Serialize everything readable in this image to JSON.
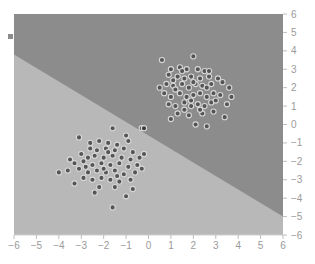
{
  "chart_data": {
    "type": "scatter",
    "title": "",
    "xlabel": "",
    "ylabel": "",
    "xlim": [
      -6,
      6
    ],
    "ylim": [
      -6,
      6
    ],
    "grid": false,
    "legend": null,
    "x_ticks": [
      -6,
      -5,
      -4,
      -3,
      -2,
      -1,
      0,
      1,
      2,
      3,
      4,
      5,
      6
    ],
    "y_ticks": [
      6,
      5,
      4,
      3,
      2,
      1,
      0,
      -1,
      -2,
      -3,
      -4,
      -5,
      -6
    ],
    "y_axis_position": "right",
    "decision_boundary": {
      "type": "line",
      "from": [
        -6,
        3.8
      ],
      "to": [
        6,
        -5.0
      ],
      "region_upper_color": "#8c8c8c",
      "region_lower_color": "#b8b8b8"
    },
    "series": [
      {
        "name": "class_upper_right",
        "center": [
          2,
          2
        ],
        "point_color": "#555555",
        "points": [
          [
            0.6,
            3.5
          ],
          [
            2.0,
            3.7
          ],
          [
            1.0,
            3.0
          ],
          [
            1.4,
            3.1
          ],
          [
            1.7,
            3.0
          ],
          [
            2.2,
            3.0
          ],
          [
            2.5,
            2.9
          ],
          [
            0.9,
            2.7
          ],
          [
            1.3,
            2.6
          ],
          [
            1.6,
            2.5
          ],
          [
            1.9,
            2.6
          ],
          [
            2.3,
            2.5
          ],
          [
            2.7,
            2.6
          ],
          [
            3.1,
            2.5
          ],
          [
            0.8,
            2.2
          ],
          [
            1.1,
            2.1
          ],
          [
            1.5,
            2.2
          ],
          [
            1.8,
            2.0
          ],
          [
            2.1,
            2.2
          ],
          [
            2.4,
            2.1
          ],
          [
            2.8,
            2.2
          ],
          [
            3.3,
            2.3
          ],
          [
            3.6,
            2.0
          ],
          [
            0.7,
            1.7
          ],
          [
            1.0,
            1.5
          ],
          [
            1.4,
            1.7
          ],
          [
            1.7,
            1.5
          ],
          [
            2.0,
            1.6
          ],
          [
            2.3,
            1.7
          ],
          [
            2.6,
            1.5
          ],
          [
            2.9,
            1.7
          ],
          [
            3.2,
            1.6
          ],
          [
            0.9,
            1.1
          ],
          [
            1.2,
            1.0
          ],
          [
            1.6,
            1.2
          ],
          [
            1.9,
            1.0
          ],
          [
            2.2,
            1.1
          ],
          [
            2.5,
            1.0
          ],
          [
            2.8,
            1.2
          ],
          [
            3.5,
            1.1
          ],
          [
            1.3,
            0.6
          ],
          [
            1.8,
            0.5
          ],
          [
            2.4,
            0.6
          ],
          [
            2.9,
            0.7
          ],
          [
            3.4,
            0.4
          ],
          [
            1.0,
            0.3
          ],
          [
            2.1,
            0.0
          ],
          [
            2.6,
            -0.1
          ],
          [
            1.5,
            2.9
          ],
          [
            2.0,
            2.3
          ],
          [
            1.2,
            1.9
          ],
          [
            2.6,
            2.0
          ],
          [
            1.9,
            1.3
          ],
          [
            2.3,
            0.8
          ],
          [
            1.6,
            0.8
          ],
          [
            3.0,
            1.3
          ],
          [
            2.7,
            2.9
          ],
          [
            1.1,
            2.4
          ],
          [
            3.7,
            1.5
          ],
          [
            0.5,
            2.0
          ]
        ]
      },
      {
        "name": "class_lower_left",
        "center": [
          -2,
          -2
        ],
        "point_color": "#555555",
        "points": [
          [
            -1.6,
            -0.2
          ],
          [
            -0.3,
            -0.2
          ],
          [
            -3.1,
            -0.7
          ],
          [
            -2.2,
            -0.9
          ],
          [
            -1.8,
            -1.0
          ],
          [
            -1.4,
            -1.1
          ],
          [
            -0.9,
            -0.9
          ],
          [
            -2.6,
            -1.3
          ],
          [
            -2.3,
            -1.4
          ],
          [
            -1.9,
            -1.3
          ],
          [
            -1.5,
            -1.4
          ],
          [
            -1.1,
            -1.3
          ],
          [
            -0.7,
            -1.5
          ],
          [
            -0.2,
            -1.6
          ],
          [
            -3.0,
            -1.6
          ],
          [
            -2.7,
            -1.8
          ],
          [
            -2.4,
            -1.7
          ],
          [
            -2.0,
            -1.8
          ],
          [
            -1.6,
            -1.7
          ],
          [
            -1.2,
            -1.8
          ],
          [
            -0.8,
            -1.9
          ],
          [
            -0.4,
            -1.8
          ],
          [
            -3.3,
            -2.1
          ],
          [
            -2.9,
            -2.0
          ],
          [
            -2.5,
            -2.2
          ],
          [
            -2.1,
            -2.1
          ],
          [
            -1.7,
            -2.2
          ],
          [
            -1.3,
            -2.1
          ],
          [
            -0.9,
            -2.3
          ],
          [
            -0.5,
            -2.2
          ],
          [
            -3.6,
            -2.5
          ],
          [
            -3.1,
            -2.4
          ],
          [
            -2.7,
            -2.6
          ],
          [
            -2.3,
            -2.5
          ],
          [
            -1.9,
            -2.6
          ],
          [
            -1.5,
            -2.5
          ],
          [
            -1.1,
            -2.7
          ],
          [
            -0.6,
            -2.6
          ],
          [
            -4.0,
            -2.6
          ],
          [
            -2.9,
            -2.9
          ],
          [
            -2.5,
            -3.0
          ],
          [
            -2.1,
            -2.9
          ],
          [
            -1.7,
            -3.0
          ],
          [
            -1.3,
            -3.1
          ],
          [
            -0.8,
            -3.0
          ],
          [
            -3.3,
            -3.2
          ],
          [
            -2.2,
            -3.4
          ],
          [
            -1.5,
            -3.4
          ],
          [
            -0.7,
            -3.5
          ],
          [
            -1.0,
            -3.9
          ],
          [
            -1.6,
            -4.5
          ],
          [
            -2.6,
            -1.0
          ],
          [
            -1.0,
            -0.6
          ],
          [
            -2.0,
            -2.4
          ],
          [
            -1.8,
            -1.5
          ],
          [
            -2.8,
            -2.3
          ],
          [
            -1.4,
            -2.8
          ],
          [
            -3.5,
            -1.9
          ],
          [
            -0.3,
            -2.4
          ],
          [
            -2.4,
            -3.7
          ]
        ]
      },
      {
        "name": "outliers_near_boundary",
        "point_color": "#3a3a3a",
        "points": [
          [
            -0.2,
            -0.2
          ]
        ]
      }
    ]
  }
}
